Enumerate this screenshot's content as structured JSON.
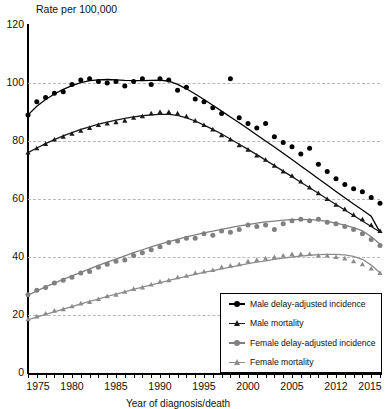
{
  "chart_data": {
    "type": "line",
    "title": "",
    "ylabel": "Rate per 100,000",
    "xlabel": "Year of diagnosis/death",
    "ylim": [
      0,
      120
    ],
    "yticks": [
      0,
      20,
      40,
      60,
      80,
      100,
      120
    ],
    "xlim": [
      1975,
      2015
    ],
    "xticks": [
      1975,
      1980,
      1985,
      1990,
      1995,
      2000,
      2005,
      2012,
      2015
    ],
    "xtick_positions": [
      1975,
      1980,
      1985,
      1990,
      1995,
      2000,
      2005,
      2010,
      2015
    ],
    "grid": true,
    "legend_position": "bottom-right",
    "x": [
      1975,
      1976,
      1977,
      1978,
      1979,
      1980,
      1981,
      1982,
      1983,
      1984,
      1985,
      1986,
      1987,
      1988,
      1989,
      1990,
      1991,
      1992,
      1993,
      1994,
      1995,
      1996,
      1997,
      1998,
      1999,
      2000,
      2001,
      2002,
      2003,
      2004,
      2005,
      2006,
      2007,
      2008,
      2009,
      2010,
      2011,
      2012,
      2013,
      2014,
      2015
    ],
    "series": [
      {
        "name": "Male delay-adjusted incidence",
        "color": "#000000",
        "marker": "circle",
        "points": [
          89.0,
          93.5,
          95.0,
          96.5,
          97.0,
          99.5,
          101.0,
          101.5,
          100.5,
          100.0,
          100.5,
          99.0,
          100.5,
          101.5,
          99.5,
          101.5,
          101.0,
          97.5,
          98.5,
          94.5,
          93.5,
          91.5,
          89.5,
          101.5,
          88.0,
          86.0,
          84.5,
          86.0,
          81.5,
          79.5,
          78.0,
          75.5,
          77.5,
          72.0,
          69.5,
          67.0,
          65.0,
          63.5,
          62.5,
          60.5,
          58.5
        ],
        "smooth": [
          89.0,
          92.0,
          94.3,
          96.2,
          97.8,
          99.1,
          100.1,
          100.8,
          101.1,
          101.2,
          101.1,
          100.9,
          100.8,
          100.8,
          100.9,
          101.0,
          100.6,
          99.5,
          98.0,
          96.2,
          94.3,
          92.3,
          90.3,
          88.3,
          86.3,
          84.2,
          82.1,
          80.0,
          77.9,
          75.8,
          73.6,
          71.4,
          69.2,
          67.0,
          64.8,
          62.6,
          60.4,
          58.3,
          56.2,
          54.1,
          48.5
        ]
      },
      {
        "name": "Male mortality",
        "color": "#1a1a1a",
        "marker": "triangle",
        "points": [
          76.0,
          77.5,
          79.0,
          80.5,
          81.5,
          82.5,
          83.5,
          84.5,
          85.5,
          86.0,
          86.5,
          87.0,
          88.0,
          88.5,
          89.5,
          90.0,
          90.0,
          89.5,
          88.5,
          87.0,
          85.5,
          84.0,
          82.0,
          80.5,
          78.5,
          77.0,
          75.0,
          73.5,
          71.5,
          69.5,
          68.0,
          66.0,
          64.0,
          62.0,
          60.0,
          58.0,
          56.5,
          54.5,
          53.0,
          51.0,
          49.0
        ],
        "smooth": [
          76.0,
          77.6,
          79.1,
          80.5,
          81.8,
          82.9,
          84.0,
          84.9,
          85.8,
          86.5,
          87.2,
          87.8,
          88.3,
          88.7,
          89.0,
          89.2,
          89.2,
          88.8,
          88.0,
          86.9,
          85.5,
          84.0,
          82.4,
          80.7,
          78.9,
          77.1,
          75.3,
          73.4,
          71.5,
          69.6,
          67.7,
          65.8,
          63.9,
          62.0,
          60.0,
          58.1,
          56.2,
          54.3,
          52.4,
          50.5,
          48.6
        ]
      },
      {
        "name": "Female delay-adjusted incidence",
        "color": "#808080",
        "marker": "circle",
        "points": [
          27.0,
          28.5,
          29.5,
          31.0,
          32.0,
          33.0,
          34.5,
          35.0,
          36.5,
          37.5,
          38.5,
          39.0,
          40.5,
          41.5,
          42.5,
          43.5,
          45.0,
          45.5,
          46.5,
          46.5,
          48.0,
          47.5,
          49.0,
          48.5,
          49.5,
          51.0,
          50.5,
          51.0,
          49.5,
          51.5,
          52.5,
          53.0,
          52.5,
          53.0,
          52.0,
          51.5,
          50.5,
          49.5,
          48.0,
          46.0,
          44.0
        ],
        "smooth": [
          26.8,
          28.3,
          29.7,
          31.0,
          32.3,
          33.5,
          34.7,
          35.9,
          37.1,
          38.2,
          39.3,
          40.4,
          41.5,
          42.5,
          43.5,
          44.4,
          45.3,
          46.1,
          46.9,
          47.6,
          48.3,
          48.9,
          49.5,
          50.1,
          50.7,
          51.2,
          51.7,
          52.1,
          52.4,
          52.7,
          52.9,
          53.0,
          52.9,
          52.7,
          52.3,
          51.7,
          51.0,
          50.1,
          49.0,
          47.0,
          44.5
        ]
      },
      {
        "name": "Female mortality",
        "color": "#8c8c8c",
        "marker": "triangle",
        "points": [
          18.5,
          19.5,
          20.5,
          21.5,
          22.0,
          23.0,
          24.0,
          24.5,
          25.5,
          26.5,
          27.0,
          28.0,
          29.0,
          29.5,
          30.5,
          31.5,
          32.0,
          33.0,
          33.5,
          34.5,
          35.0,
          35.5,
          36.5,
          37.0,
          37.5,
          38.5,
          39.0,
          39.5,
          40.0,
          40.5,
          41.0,
          41.0,
          41.0,
          40.5,
          40.5,
          40.0,
          39.5,
          38.5,
          37.5,
          36.0,
          34.5
        ],
        "smooth": [
          18.4,
          19.3,
          20.2,
          21.1,
          22.0,
          22.9,
          23.8,
          24.7,
          25.5,
          26.4,
          27.2,
          28.0,
          28.8,
          29.6,
          30.4,
          31.1,
          31.9,
          32.6,
          33.3,
          34.0,
          34.7,
          35.3,
          35.9,
          36.5,
          37.1,
          37.7,
          38.2,
          38.7,
          39.2,
          39.6,
          40.0,
          40.3,
          40.6,
          40.8,
          40.9,
          40.9,
          40.7,
          40.2,
          39.2,
          37.2,
          34.6
        ]
      }
    ]
  }
}
